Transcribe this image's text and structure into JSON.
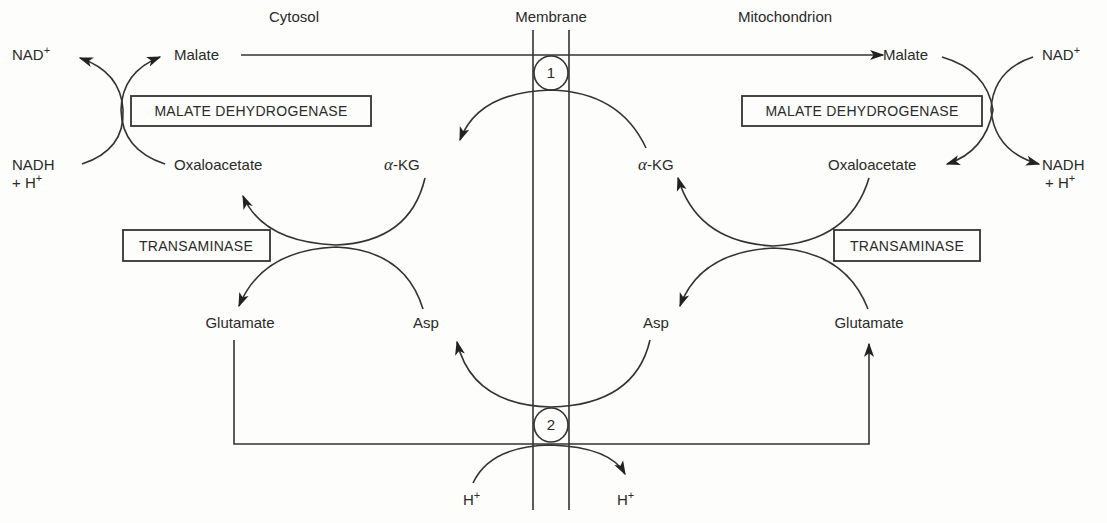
{
  "headers": {
    "cytosol": "Cytosol",
    "membrane": "Membrane",
    "mitochondrion": "Mitochondrion"
  },
  "cytosol": {
    "nad_plus": "NAD",
    "nad_plus_sup": "+",
    "nadh": "NADH",
    "nadh_h": "+ H",
    "nadh_h_sup": "+",
    "malate": "Malate",
    "oxaloacetate": "Oxaloacetate",
    "malate_dehydrogenase": "MALATE DEHYDROGENASE",
    "transaminase": "TRANSAMINASE",
    "alpha_kg_greek": "α",
    "alpha_kg": "-KG",
    "glutamate": "Glutamate",
    "asp": "Asp"
  },
  "mitochondrion": {
    "nad_plus": "NAD",
    "nad_plus_sup": "+",
    "nadh": "NADH",
    "nadh_h": "+ H",
    "nadh_h_sup": "+",
    "malate": "Malate",
    "oxaloacetate": "Oxaloacetate",
    "malate_dehydrogenase": "MALATE DEHYDROGENASE",
    "transaminase": "TRANSAMINASE",
    "alpha_kg_greek": "α",
    "alpha_kg": "-KG",
    "glutamate": "Glutamate",
    "asp": "Asp"
  },
  "transporters": {
    "t1": "1",
    "t2": "2"
  },
  "protons": {
    "left": "H",
    "left_sup": "+",
    "right": "H",
    "right_sup": "+"
  }
}
